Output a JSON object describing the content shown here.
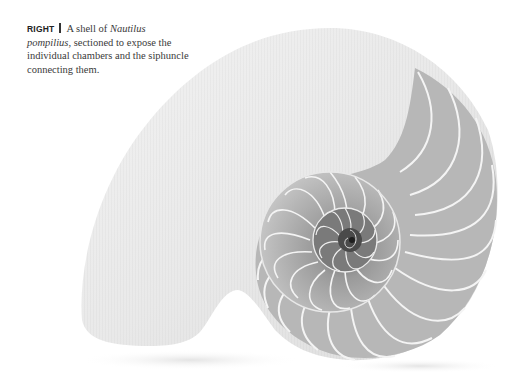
{
  "caption": {
    "label": "RIGHT",
    "text_before": "A shell of ",
    "genus": "Nautilus",
    "species": "pompilius",
    "text_after": ", sectioned to expose the individual chambers and the siphuncle connecting them."
  },
  "figure": {
    "style": "grayscale photograph"
  }
}
